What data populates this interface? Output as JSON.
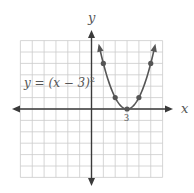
{
  "chart_data": {
    "type": "line",
    "title": "",
    "equation_label": "y = (x − 3)",
    "equation_exponent": "2",
    "xlabel": "x",
    "ylabel": "y",
    "x_tick_labels": [
      {
        "value": 3,
        "label": "3"
      }
    ],
    "xlim": [
      -6,
      6
    ],
    "ylim": [
      -6,
      6
    ],
    "grid": true,
    "series": [
      {
        "name": "y = (x − 3)^2",
        "function": "(x-3)^2",
        "x": [
          0.66,
          1,
          2,
          3,
          4,
          5,
          5.34
        ],
        "y": [
          5.5,
          4,
          1,
          0,
          1,
          4,
          5.5
        ],
        "marked_points": [
          {
            "x": 1,
            "y": 4
          },
          {
            "x": 2,
            "y": 1
          },
          {
            "x": 3,
            "y": 0
          },
          {
            "x": 4,
            "y": 1
          },
          {
            "x": 5,
            "y": 4
          }
        ]
      }
    ]
  },
  "colors": {
    "grid": "#cccccc",
    "axes": "#3a3a3a",
    "curve": "#555555",
    "text": "#555555"
  }
}
